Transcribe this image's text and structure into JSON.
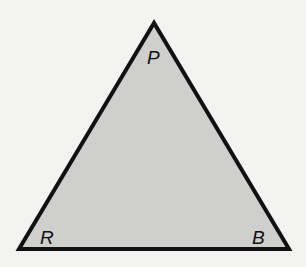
{
  "diagram": {
    "type": "triangle",
    "colors": {
      "background": "#f3f3f1",
      "fill": "#cfcfcd",
      "stroke": "#111111"
    },
    "vertices": [
      {
        "label": "P",
        "x": 154,
        "y": 23
      },
      {
        "label": "R",
        "x": 19,
        "y": 249
      },
      {
        "label": "B",
        "x": 289,
        "y": 249
      }
    ],
    "labels": {
      "p": "P",
      "r": "R",
      "b": "B"
    }
  }
}
